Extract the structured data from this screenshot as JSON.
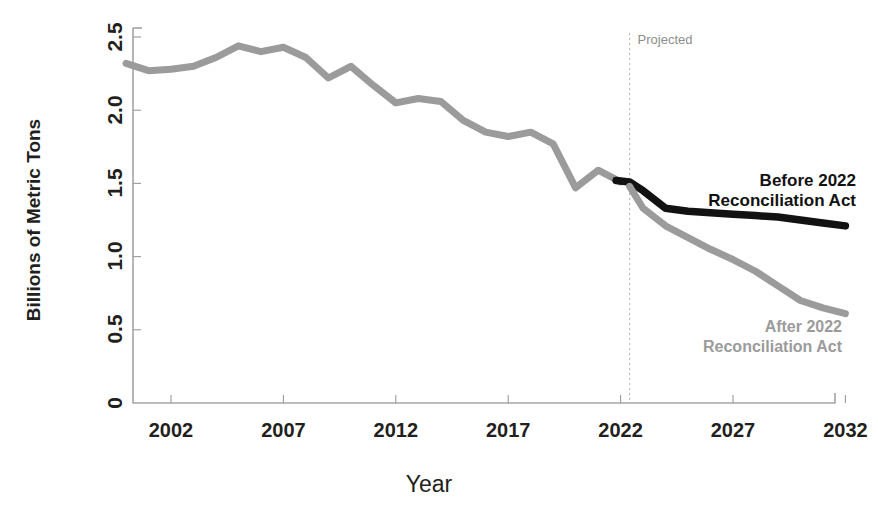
{
  "chart_data": {
    "type": "line",
    "title": "",
    "xlabel": "Year",
    "ylabel": "Billions of Metric Tons",
    "xlim": [
      2000,
      2032
    ],
    "ylim": [
      0,
      2.6
    ],
    "grid": false,
    "legend_position": "inline-annotations",
    "xticks": [
      2002,
      2007,
      2012,
      2017,
      2022,
      2027,
      2032
    ],
    "xtick_labels": [
      "2002",
      "2007",
      "2012",
      "2017",
      "2022",
      "2027",
      "2032"
    ],
    "yticks": [
      0,
      0.5,
      1.0,
      1.5,
      2.0,
      2.5
    ],
    "ytick_labels": [
      "0",
      "0.5",
      "1.0",
      "1.5",
      "2.0",
      "2.5"
    ],
    "annotations": [
      {
        "name": "projected-divider-label",
        "text": "Projected",
        "x": 2022.4,
        "color": "#8d8d8d"
      }
    ],
    "projection_start_year": 2022.4,
    "series": [
      {
        "name": "Historical",
        "color": "#9b9b9b",
        "style": "solid",
        "x": [
          2000,
          2001,
          2002,
          2003,
          2004,
          2005,
          2006,
          2007,
          2008,
          2009,
          2010,
          2011,
          2012,
          2013,
          2014,
          2015,
          2016,
          2017,
          2018,
          2019,
          2020,
          2021,
          2022
        ],
        "values": [
          2.32,
          2.27,
          2.28,
          2.3,
          2.36,
          2.44,
          2.4,
          2.43,
          2.36,
          2.22,
          2.3,
          2.17,
          2.05,
          2.08,
          2.06,
          1.93,
          1.85,
          1.82,
          1.85,
          1.77,
          1.47,
          1.59,
          1.51
        ]
      },
      {
        "name": "Before 2022 Reconciliation Act",
        "color": "#121212",
        "style": "solid",
        "projected": true,
        "x": [
          2021.8,
          2022.4,
          2023,
          2024,
          2025,
          2026,
          2027,
          2028,
          2029,
          2030,
          2031,
          2032
        ],
        "values": [
          1.52,
          1.51,
          1.45,
          1.33,
          1.31,
          1.3,
          1.29,
          1.28,
          1.27,
          1.25,
          1.23,
          1.21
        ]
      },
      {
        "name": "After 2022 Reconciliation Act",
        "color": "#9b9b9b",
        "style": "solid",
        "projected": true,
        "x": [
          2022.4,
          2023,
          2024,
          2025,
          2026,
          2027,
          2028,
          2029,
          2030,
          2031,
          2032
        ],
        "values": [
          1.48,
          1.33,
          1.21,
          1.13,
          1.05,
          0.98,
          0.9,
          0.8,
          0.7,
          0.65,
          0.61
        ]
      }
    ],
    "series_labels": [
      {
        "name": "before-2022-label",
        "lines": [
          "Before 2022",
          "Reconciliation Act"
        ],
        "color": "#121212",
        "anchor_x": 856,
        "anchor_y": 186
      },
      {
        "name": "after-2022-label",
        "lines": [
          "After 2022",
          "Reconciliation Act"
        ],
        "color": "#9b9b9b",
        "anchor_x": 842,
        "anchor_y": 332
      }
    ]
  }
}
